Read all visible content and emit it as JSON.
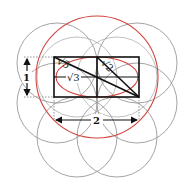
{
  "diagram": {
    "title": "",
    "colors": {
      "circle_grey": "#9a9a9a",
      "circle_red": "#d0453f",
      "lines": "#111111",
      "dotted": "#888888",
      "background": "#ffffff"
    },
    "labels": {
      "sqrt5": "√5",
      "sqrt3": "√3",
      "sqrt2": "√2",
      "height": "1",
      "width": "2"
    },
    "rectangle": {
      "x": 54,
      "y": 57,
      "width": 85,
      "height": 40
    },
    "grey_circles": [
      {
        "cx": 57,
        "cy": 63,
        "r": 40
      },
      {
        "cx": 137,
        "cy": 63,
        "r": 40
      },
      {
        "cx": 57,
        "cy": 103,
        "r": 40
      },
      {
        "cx": 137,
        "cy": 103,
        "r": 40
      },
      {
        "cx": 77,
        "cy": 137,
        "r": 40
      },
      {
        "cx": 117,
        "cy": 137,
        "r": 40
      }
    ],
    "red_circles": [
      {
        "cx": 97,
        "cy": 77,
        "r": 61
      }
    ],
    "red_ellipse": {
      "cx": 97,
      "cy": 77,
      "rx": 41,
      "ry": 20
    }
  }
}
